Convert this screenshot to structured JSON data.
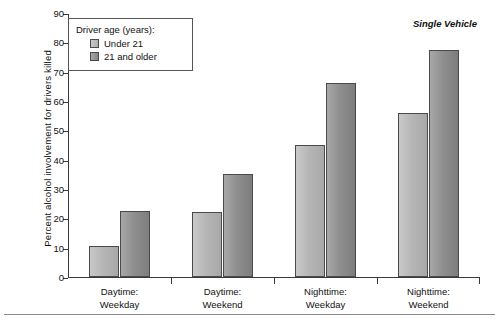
{
  "chart_data": {
    "type": "bar",
    "title": "",
    "annotation": "Single Vehicle",
    "xlabel": "",
    "ylabel": "Percent alcohol involvement for drivers killed",
    "ylim": [
      0,
      90
    ],
    "ytick_step": 10,
    "yticks": [
      0,
      10,
      20,
      30,
      40,
      50,
      60,
      70,
      80,
      90
    ],
    "grid": false,
    "legend_position": "top-left",
    "legend_title": "Driver age (years):",
    "categories": [
      "Daytime: Weekday",
      "Daytime: Weekend",
      "Nighttime: Weekday",
      "Nighttime: Weekend"
    ],
    "category_lines": [
      [
        "Daytime:",
        "Weekday"
      ],
      [
        "Daytime:",
        "Weekend"
      ],
      [
        "Nighttime:",
        "Weekday"
      ],
      [
        "Nighttime:",
        "Weekend"
      ]
    ],
    "series": [
      {
        "name": "Under 21",
        "color": "#bdbdbd",
        "values": [
          10.5,
          22,
          45,
          56
        ]
      },
      {
        "name": "21 and older",
        "color": "#8f8f8f",
        "values": [
          22.5,
          35,
          66,
          77.5
        ]
      }
    ]
  },
  "legend": {
    "title": "Driver age (years):",
    "entries": [
      {
        "label": "Under 21"
      },
      {
        "label": "21 and older"
      }
    ]
  },
  "axes": {
    "y_title": "Percent alcohol involvement for drivers killed",
    "y_labels": [
      "90",
      "80",
      "70",
      "60",
      "50",
      "40",
      "30",
      "20",
      "10",
      "0"
    ]
  },
  "annotation": {
    "text": "Single Vehicle"
  }
}
